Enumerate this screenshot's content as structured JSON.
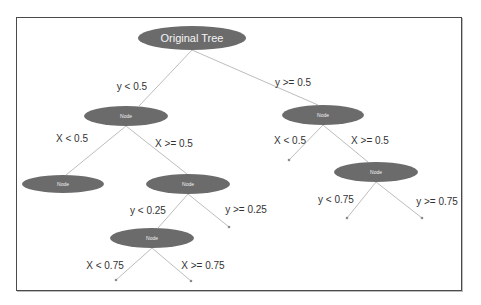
{
  "colors": {
    "node_fill": "#6b6b6b",
    "node_text": "#f2f2f2",
    "edge": "#bdbdbd",
    "frame_border": "#4a4a4a",
    "label_text": "#333333"
  },
  "nodes": [
    {
      "id": "root",
      "label": "Original Tree",
      "cx": 192,
      "cy": 38,
      "rx": 54,
      "ry": 12
    },
    {
      "id": "n_l",
      "label": "Node",
      "cx": 126,
      "cy": 116,
      "rx": 42,
      "ry": 10
    },
    {
      "id": "n_r",
      "label": "Node",
      "cx": 323,
      "cy": 115,
      "rx": 41,
      "ry": 10
    },
    {
      "id": "n_ll",
      "label": "Node",
      "cx": 63,
      "cy": 184,
      "rx": 41,
      "ry": 9
    },
    {
      "id": "n_lr",
      "label": "Node",
      "cx": 188,
      "cy": 184,
      "rx": 42,
      "ry": 10
    },
    {
      "id": "n_rr",
      "label": "Node",
      "cx": 376,
      "cy": 172,
      "rx": 42,
      "ry": 10
    },
    {
      "id": "n_lrl",
      "label": "Node",
      "cx": 152,
      "cy": 238,
      "rx": 42,
      "ry": 10
    }
  ],
  "leaves": [
    {
      "id": "leaf_rl",
      "x": 289,
      "y": 160
    },
    {
      "id": "leaf_lrr",
      "x": 229,
      "y": 227
    },
    {
      "id": "leaf_rrl",
      "x": 347,
      "y": 218
    },
    {
      "id": "leaf_rrr",
      "x": 422,
      "y": 218
    },
    {
      "id": "leaf_lrll",
      "x": 116,
      "y": 280
    },
    {
      "id": "leaf_lrlr",
      "x": 191,
      "y": 281
    }
  ],
  "edges": [
    {
      "from": [
        192,
        50
      ],
      "to": [
        139,
        106
      ],
      "label": "y < 0.5",
      "lx": 132,
      "ly": 86
    },
    {
      "from": [
        192,
        50
      ],
      "to": [
        318,
        105
      ],
      "label": "y >= 0.5",
      "lx": 293,
      "ly": 82
    },
    {
      "from": [
        126,
        126
      ],
      "to": [
        66,
        175
      ],
      "label": "X < 0.5",
      "lx": 72,
      "ly": 138
    },
    {
      "from": [
        126,
        126
      ],
      "to": [
        187,
        174
      ],
      "label": "X >= 0.5",
      "lx": 174,
      "ly": 143
    },
    {
      "from": [
        323,
        125
      ],
      "to": [
        289,
        160
      ],
      "label": "X < 0.5",
      "lx": 290,
      "ly": 140
    },
    {
      "from": [
        323,
        125
      ],
      "to": [
        368,
        162
      ],
      "label": "X >= 0.5",
      "lx": 370,
      "ly": 140
    },
    {
      "from": [
        188,
        194
      ],
      "to": [
        158,
        228
      ],
      "label": "y < 0.25",
      "lx": 148,
      "ly": 210
    },
    {
      "from": [
        188,
        194
      ],
      "to": [
        229,
        227
      ],
      "label": "y >= 0.25",
      "lx": 246,
      "ly": 209
    },
    {
      "from": [
        376,
        182
      ],
      "to": [
        347,
        218
      ],
      "label": "y < 0.75",
      "lx": 336,
      "ly": 199
    },
    {
      "from": [
        376,
        182
      ],
      "to": [
        422,
        218
      ],
      "label": "y >= 0.75",
      "lx": 437,
      "ly": 201
    },
    {
      "from": [
        152,
        248
      ],
      "to": [
        116,
        280
      ],
      "label": "X < 0.75",
      "lx": 105,
      "ly": 265
    },
    {
      "from": [
        152,
        248
      ],
      "to": [
        191,
        281
      ],
      "label": "X >= 0.75",
      "lx": 203,
      "ly": 265
    }
  ]
}
